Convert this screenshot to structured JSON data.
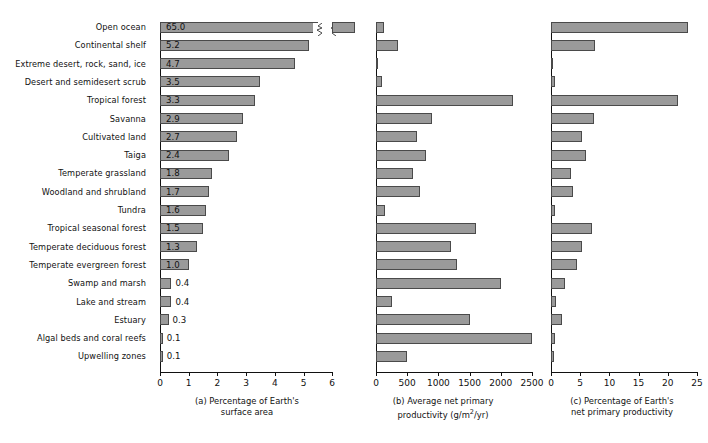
{
  "figure": {
    "title": "",
    "row_labels": [
      "Open ocean",
      "Continental shelf",
      "Extreme desert, rock, sand, ice",
      "Desert and semidesert scrub",
      "Tropical forest",
      "Savanna",
      "Cultivated land",
      "Taiga",
      "Temperate grassland",
      "Woodland and shrubland",
      "Tundra",
      "Tropical seasonal forest",
      "Temperate deciduous forest",
      "Temperate evergreen forest",
      "Swamp and marsh",
      "Lake and stream",
      "Estuary",
      "Algal beds and coral reefs",
      "Upwelling zones"
    ],
    "bar_fill_color": "#9a9a9a",
    "bar_edge_color": "#4a4a4a",
    "axis_color": "#111111"
  },
  "chart_data": [
    {
      "type": "bar",
      "panel": "a",
      "title": "(a) Percentage of Earth's\nsurface area",
      "xlabel": "",
      "ylabel": "",
      "orientation": "horizontal",
      "axis_break": true,
      "axis_break_note": "Open ocean bar is broken; true value 65.0 exceeds axis max",
      "xlim": [
        0,
        6.8
      ],
      "ticks": [
        0,
        1,
        2,
        3,
        4,
        5,
        6
      ],
      "tick_labels": [
        "0",
        "1",
        "2",
        "3",
        "4",
        "5",
        "6"
      ],
      "categories": [
        "Open ocean",
        "Continental shelf",
        "Extreme desert, rock, sand, ice",
        "Desert and semidesert scrub",
        "Tropical forest",
        "Savanna",
        "Cultivated land",
        "Taiga",
        "Temperate grassland",
        "Woodland and shrubland",
        "Tundra",
        "Tropical seasonal forest",
        "Temperate deciduous forest",
        "Temperate evergreen forest",
        "Swamp and marsh",
        "Lake and stream",
        "Estuary",
        "Algal beds and coral reefs",
        "Upwelling zones"
      ],
      "values": [
        65.0,
        5.2,
        4.7,
        3.5,
        3.3,
        2.9,
        2.7,
        2.4,
        1.8,
        1.7,
        1.6,
        1.5,
        1.3,
        1.0,
        0.4,
        0.4,
        0.3,
        0.1,
        0.1
      ],
      "data_labels": [
        "65.0",
        "5.2",
        "4.7",
        "3.5",
        "3.3",
        "2.9",
        "2.7",
        "2.4",
        "1.8",
        "1.7",
        "1.6",
        "1.5",
        "1.3",
        "1.0",
        "0.4",
        "0.4",
        "0.3",
        "0.1",
        "0.1"
      ]
    },
    {
      "type": "bar",
      "panel": "b",
      "title": "(b) Average net primary\nproductivity (g/m2/yr)",
      "title_line1": "(b) Average net primary",
      "title_line2_pre": "productivity (g/m",
      "title_line2_sup": "2",
      "title_line2_post": "/yr)",
      "xlabel": "",
      "ylabel": "",
      "orientation": "horizontal",
      "xlim": [
        0,
        2650
      ],
      "ticks": [
        0,
        500,
        1000,
        1500,
        2000,
        2500
      ],
      "tick_labels": [
        "0",
        "500",
        "1000",
        "1500",
        "2000",
        "2500"
      ],
      "categories": [
        "Open ocean",
        "Continental shelf",
        "Extreme desert, rock, sand, ice",
        "Desert and semidesert scrub",
        "Tropical forest",
        "Savanna",
        "Cultivated land",
        "Taiga",
        "Temperate grassland",
        "Woodland and shrubland",
        "Tundra",
        "Tropical seasonal forest",
        "Temperate deciduous forest",
        "Temperate evergreen forest",
        "Swamp and marsh",
        "Lake and stream",
        "Estuary",
        "Algal beds and coral reefs",
        "Upwelling zones"
      ],
      "values": [
        125,
        360,
        30,
        90,
        2200,
        900,
        650,
        800,
        600,
        700,
        140,
        1600,
        1200,
        1300,
        2000,
        250,
        1500,
        2500,
        500
      ]
    },
    {
      "type": "bar",
      "panel": "c",
      "title": "(c) Percentage of Earth's\nnet primary productivity",
      "xlabel": "",
      "ylabel": "",
      "orientation": "horizontal",
      "xlim": [
        0,
        25.5
      ],
      "ticks": [
        0,
        5,
        10,
        15,
        20,
        25
      ],
      "tick_labels": [
        "0",
        "5",
        "10",
        "15",
        "20",
        "25"
      ],
      "categories": [
        "Open ocean",
        "Continental shelf",
        "Extreme desert, rock, sand, ice",
        "Desert and semidesert scrub",
        "Tropical forest",
        "Savanna",
        "Cultivated land",
        "Taiga",
        "Temperate grassland",
        "Woodland and shrubland",
        "Tundra",
        "Tropical seasonal forest",
        "Temperate deciduous forest",
        "Temperate evergreen forest",
        "Swamp and marsh",
        "Lake and stream",
        "Estuary",
        "Algal beds and coral reefs",
        "Upwelling zones"
      ],
      "values": [
        23.5,
        7.5,
        0.2,
        0.6,
        21.7,
        7.4,
        5.3,
        6.0,
        3.4,
        3.8,
        0.6,
        7.1,
        5.3,
        4.4,
        2.4,
        0.8,
        1.9,
        0.7,
        0.5
      ]
    }
  ]
}
